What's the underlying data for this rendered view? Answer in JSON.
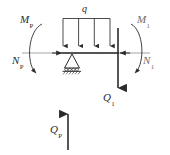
{
  "figure": {
    "type": "free-body-diagram",
    "background_color": "#ffffff",
    "stroke_color": "#2b2b2b",
    "faint_stroke_color": "#8a8a8a",
    "width": 170,
    "height": 155
  },
  "labels": {
    "distributed_load": {
      "symbol": "q",
      "sub": "",
      "x": 85,
      "y": 8
    },
    "moment_left": {
      "symbol": "M",
      "sub": "P",
      "x": 22,
      "y": 18
    },
    "moment_right": {
      "symbol": "M",
      "sub": "1",
      "x": 139,
      "y": 18
    },
    "normal_left": {
      "symbol": "N",
      "sub": "P",
      "x": 15,
      "y": 57
    },
    "normal_right": {
      "symbol": "N",
      "sub": "1",
      "x": 145,
      "y": 57
    },
    "shear_right": {
      "symbol": "Q",
      "sub": "1",
      "x": 104,
      "y": 96
    },
    "shear_bottom": {
      "symbol": "Q",
      "sub": "P",
      "x": 52,
      "y": 128
    }
  },
  "elements": {
    "beam": {
      "name": "beam-axis",
      "y": 53,
      "x_start": 22,
      "x_end": 150
    },
    "beam_solid": {
      "x_start": 62,
      "x_end": 118
    },
    "load_box": {
      "x_start": 63,
      "x_end": 110,
      "y_top": 18,
      "arrow_count": 4
    },
    "support": {
      "name": "pin-support",
      "x": 72,
      "y": 53,
      "type": "pinned-hatched"
    },
    "vertical_member": {
      "x": 118,
      "y_top": 28,
      "y_bottom": 92
    },
    "bottom_arrow": {
      "x": 68,
      "y_top": 112,
      "y_bottom": 150,
      "direction": "up"
    },
    "moment_arc_left": {
      "direction": "clockwise-open-right"
    },
    "moment_arc_right": {
      "direction": "counterclockwise-open-left"
    }
  }
}
